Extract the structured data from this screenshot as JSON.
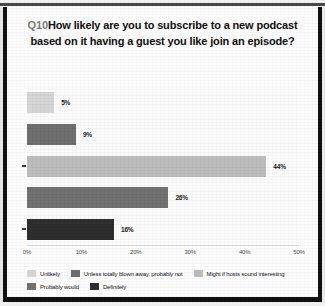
{
  "title": {
    "prefix": "Q10",
    "text": "How likely are you to subscribe to a new podcast based on it having a guest you like join an episode?"
  },
  "chart_data": {
    "type": "bar",
    "orientation": "horizontal",
    "xlabel": "",
    "ylabel": "",
    "xlim": [
      0,
      50
    ],
    "grid": false,
    "legend_position": "bottom",
    "categories": [
      "Unlikely",
      "Unless totally blown away, probably not",
      "Might if hosts sound interesting",
      "Probably would",
      "Definitely"
    ],
    "values": [
      5,
      9,
      44,
      26,
      16
    ],
    "value_labels": [
      "5%",
      "9%",
      "44%",
      "26%",
      "16%"
    ],
    "colors": [
      "#d6d6d6",
      "#6f6f6f",
      "#bdbdbd",
      "#727272",
      "#2e2e2e"
    ],
    "xticks": [
      0,
      10,
      20,
      30,
      40,
      50
    ],
    "xtick_labels": [
      "0%",
      "10%",
      "20%",
      "30%",
      "40%",
      "50%"
    ]
  },
  "legend": {
    "rows": [
      [
        {
          "label": "Unlikely",
          "color": "#d6d6d6"
        },
        {
          "label": "Unless totally blown away, probably not",
          "color": "#6f6f6f"
        },
        {
          "label": "Might if hosts sound interesting",
          "color": "#bdbdbd"
        }
      ],
      [
        {
          "label": "Probably would",
          "color": "#727272"
        },
        {
          "label": "Definitely",
          "color": "#2e2e2e"
        }
      ]
    ]
  }
}
